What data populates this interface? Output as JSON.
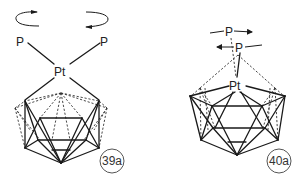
{
  "figure": {
    "structures": [
      {
        "id": "39a",
        "label": "39a",
        "metal": "Pt",
        "ligands": [
          "P",
          "P"
        ],
        "motion": "rotation of PtP2 fragment (two curved arrows)"
      },
      {
        "id": "40a",
        "label": "40a",
        "metal": "Pt",
        "ligands": [
          "P",
          "P"
        ],
        "motion": "rotation of P2 ligands (straight arrows)"
      }
    ],
    "colors": {
      "line": "#1a1a1a",
      "background": "#ffffff"
    }
  }
}
